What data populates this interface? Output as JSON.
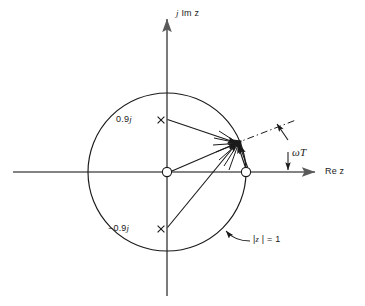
{
  "figure": {
    "kind": "pole-zero-plot-z-plane",
    "background": "#ffffff",
    "ink": "#1a1a1a",
    "axis_color": "#5a5a5a",
    "width": 365,
    "height": 306
  },
  "axes": {
    "imaginary_label": "j Im z",
    "real_label": "Re z",
    "origin": {
      "x": 167,
      "y": 172
    },
    "vertical": {
      "x": 167,
      "top": 16,
      "bottom": 296
    },
    "horizontal": {
      "y": 172,
      "left": 13,
      "right": 318
    }
  },
  "unit_circle": {
    "label": "|z | = 1",
    "radius_px": 79,
    "center": {
      "x": 167,
      "y": 172
    },
    "magnitude": 1
  },
  "poles": [
    {
      "label": "0.9j",
      "value": 0.9,
      "marker": "x-marker",
      "x": 161,
      "y": 120,
      "label_x": 116,
      "label_y": 114
    },
    {
      "label": "−0.9j",
      "value": -0.9,
      "marker": "x-marker",
      "x": 161,
      "y": 229,
      "label_x": 110,
      "label_y": 223
    }
  ],
  "zeros": [
    {
      "name": "zero-at-origin",
      "x": 167,
      "y": 172,
      "value": "0"
    },
    {
      "name": "zero-at-one",
      "x": 246,
      "y": 172,
      "value": "1"
    }
  ],
  "evaluation_point": {
    "x": 237,
    "y": 143,
    "on_circle": true
  },
  "angle": {
    "label": "ωT",
    "label_x": 297,
    "label_y": 147,
    "dashdot_line": {
      "x1": 237,
      "y1": 143,
      "x2": 295,
      "y2": 121
    }
  },
  "circle_callout": {
    "text": "|z | = 1",
    "label_x": 252,
    "label_y": 240
  }
}
